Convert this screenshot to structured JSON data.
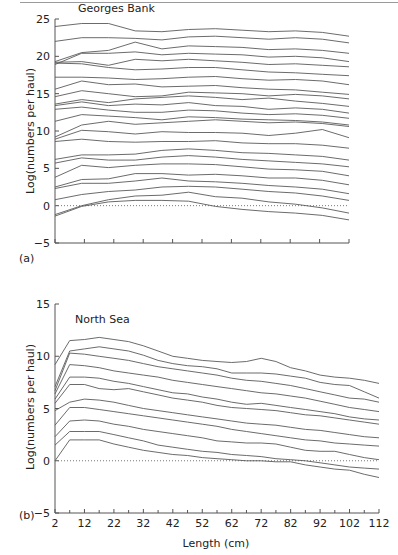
{
  "figure": {
    "panel_a_label": "(a)",
    "panel_b_label": "(b)"
  },
  "chart_data": [
    {
      "type": "line",
      "panel": "(a)",
      "title": "Georges Bank",
      "xlabel": "",
      "ylabel": "Log(numbers per haul)",
      "ylim": [
        -5,
        25
      ],
      "yticks": [
        -5,
        0,
        5,
        10,
        15,
        20,
        25
      ],
      "xticks_count": 10,
      "xlim": [
        2,
        112
      ],
      "x": [
        2,
        12,
        22,
        32,
        42,
        52,
        62,
        72,
        82,
        92,
        102,
        112
      ],
      "reference_line": {
        "y": 0,
        "style": "dotted"
      },
      "series": [
        {
          "name": "cohort 1",
          "values": [
            24.0,
            24.4,
            24.4,
            23.4,
            23.3,
            23.6,
            23.7,
            23.5,
            23.3,
            23.4,
            23.2,
            22.7
          ]
        },
        {
          "name": "cohort 2",
          "values": [
            22.0,
            22.5,
            22.5,
            22.4,
            22.2,
            22.6,
            22.7,
            22.5,
            22.3,
            22.5,
            22.3,
            21.8
          ]
        },
        {
          "name": "cohort 3",
          "values": [
            19.3,
            20.5,
            20.8,
            21.9,
            21.0,
            21.4,
            21.3,
            21.2,
            20.9,
            21.0,
            20.8,
            20.4
          ]
        },
        {
          "name": "cohort 4",
          "values": [
            18.9,
            20.4,
            20.4,
            20.6,
            20.2,
            20.4,
            20.3,
            20.2,
            19.9,
            20.0,
            19.8,
            19.3
          ]
        },
        {
          "name": "cohort 5",
          "values": [
            19.2,
            19.3,
            18.8,
            19.6,
            19.4,
            19.6,
            19.4,
            19.2,
            18.9,
            19.0,
            18.8,
            18.6
          ]
        },
        {
          "name": "cohort 6",
          "values": [
            19.1,
            19.0,
            18.5,
            18.2,
            18.3,
            18.5,
            18.5,
            18.2,
            17.9,
            17.8,
            17.6,
            17.4
          ]
        },
        {
          "name": "cohort 7",
          "values": [
            17.2,
            17.2,
            17.1,
            16.9,
            17.0,
            17.2,
            17.3,
            17.0,
            16.8,
            16.9,
            16.7,
            16.2
          ]
        },
        {
          "name": "cohort 8",
          "values": [
            15.6,
            16.7,
            16.2,
            16.3,
            15.9,
            16.0,
            16.1,
            15.8,
            15.6,
            15.5,
            15.2,
            14.9
          ]
        },
        {
          "name": "cohort 9",
          "values": [
            14.6,
            15.4,
            15.0,
            14.6,
            14.7,
            15.2,
            15.1,
            15.0,
            14.7,
            14.9,
            14.7,
            14.3
          ]
        },
        {
          "name": "cohort 10",
          "values": [
            13.6,
            14.2,
            13.8,
            14.3,
            14.5,
            14.7,
            14.5,
            14.2,
            14.4,
            14.0,
            13.7,
            13.3
          ]
        },
        {
          "name": "cohort 11",
          "values": [
            13.4,
            13.9,
            13.4,
            13.6,
            13.5,
            13.8,
            13.4,
            13.3,
            12.9,
            13.1,
            12.9,
            12.4
          ]
        },
        {
          "name": "cohort 12",
          "values": [
            12.9,
            13.2,
            12.8,
            12.5,
            12.5,
            12.8,
            12.7,
            12.4,
            12.2,
            12.3,
            12.1,
            11.7
          ]
        },
        {
          "name": "cohort 13",
          "values": [
            11.3,
            12.2,
            12.0,
            11.8,
            11.5,
            11.9,
            11.8,
            11.6,
            11.5,
            11.4,
            11.2,
            10.8
          ]
        },
        {
          "name": "cohort 14",
          "values": [
            9.2,
            10.8,
            11.3,
            10.9,
            11.1,
            11.3,
            11.5,
            11.3,
            11.1,
            11.2,
            11.0,
            10.6
          ]
        },
        {
          "name": "cohort 15",
          "values": [
            8.9,
            10.1,
            9.9,
            9.6,
            9.9,
            9.8,
            9.8,
            9.7,
            9.4,
            9.7,
            10.2,
            9.1
          ]
        },
        {
          "name": "cohort 16",
          "values": [
            8.6,
            8.9,
            8.6,
            8.5,
            8.6,
            8.6,
            8.7,
            8.4,
            8.3,
            8.3,
            8.1,
            7.7
          ]
        },
        {
          "name": "cohort 17",
          "values": [
            6.2,
            6.8,
            6.8,
            6.9,
            7.4,
            7.6,
            7.4,
            7.1,
            7.0,
            6.8,
            6.6,
            6.1
          ]
        },
        {
          "name": "cohort 18",
          "values": [
            5.7,
            6.4,
            6.1,
            6.1,
            6.5,
            6.7,
            6.5,
            6.2,
            6.0,
            5.8,
            5.6,
            5.2
          ]
        },
        {
          "name": "cohort 19",
          "values": [
            3.8,
            5.4,
            5.1,
            5.4,
            5.6,
            5.6,
            5.5,
            5.2,
            4.9,
            4.8,
            4.6,
            4.0
          ]
        },
        {
          "name": "cohort 20",
          "values": [
            2.5,
            3.5,
            3.6,
            4.3,
            4.3,
            4.1,
            4.2,
            4.0,
            3.7,
            3.7,
            3.4,
            2.8
          ]
        },
        {
          "name": "cohort 21",
          "values": [
            2.3,
            3.0,
            3.0,
            3.3,
            3.7,
            3.3,
            3.2,
            3.0,
            2.7,
            2.5,
            2.2,
            1.6
          ]
        },
        {
          "name": "cohort 22",
          "values": [
            0.8,
            1.5,
            1.9,
            2.1,
            2.5,
            2.6,
            2.5,
            2.2,
            1.9,
            1.7,
            1.3,
            0.7
          ]
        },
        {
          "name": "cohort 23",
          "values": [
            -1.2,
            0.0,
            0.8,
            1.3,
            1.4,
            1.8,
            1.2,
            1.0,
            0.5,
            0.2,
            -0.3,
            -1.0
          ]
        },
        {
          "name": "cohort 24",
          "values": [
            -1.4,
            -0.1,
            0.5,
            0.7,
            0.7,
            0.6,
            -0.1,
            -0.5,
            -0.8,
            -1.0,
            -1.3,
            -1.9
          ]
        }
      ]
    },
    {
      "type": "line",
      "panel": "(b)",
      "title": "North Sea",
      "xlabel": "Length (cm)",
      "ylabel": "Log(numbers per haul)",
      "ylim": [
        -5,
        15
      ],
      "yticks": [
        -5,
        0,
        5,
        10,
        15
      ],
      "xlim": [
        2,
        112
      ],
      "xticks": [
        2,
        12,
        22,
        32,
        42,
        52,
        62,
        72,
        82,
        92,
        102,
        112
      ],
      "x": [
        2,
        7,
        12,
        17,
        22,
        27,
        32,
        37,
        42,
        47,
        52,
        57,
        62,
        67,
        72,
        77,
        82,
        87,
        92,
        97,
        102,
        107,
        112
      ],
      "reference_line": {
        "y": 0,
        "style": "dotted"
      },
      "series": [
        {
          "name": "cohort 1",
          "values": [
            9.2,
            11.5,
            11.6,
            11.8,
            11.6,
            11.4,
            11.0,
            10.5,
            10.0,
            9.8,
            9.6,
            9.5,
            9.4,
            9.5,
            9.8,
            9.5,
            8.9,
            8.6,
            8.2,
            8.0,
            7.9,
            7.7,
            7.4
          ]
        },
        {
          "name": "cohort 2",
          "values": [
            7.1,
            10.5,
            10.7,
            10.9,
            10.7,
            10.5,
            10.1,
            9.6,
            9.3,
            9.1,
            9.0,
            8.8,
            8.4,
            8.4,
            8.4,
            8.3,
            8.1,
            7.9,
            7.5,
            7.3,
            7.2,
            6.6,
            6.0
          ]
        },
        {
          "name": "cohort 3",
          "values": [
            6.7,
            10.3,
            10.2,
            10.0,
            9.8,
            9.6,
            9.3,
            9.0,
            8.8,
            8.6,
            8.4,
            8.2,
            7.9,
            7.7,
            7.6,
            7.4,
            7.2,
            6.9,
            6.6,
            6.3,
            6.0,
            5.9,
            5.6
          ]
        },
        {
          "name": "cohort 4",
          "values": [
            6.4,
            9.2,
            9.1,
            8.9,
            8.6,
            8.4,
            8.2,
            8.0,
            7.7,
            7.5,
            7.3,
            7.1,
            6.9,
            6.7,
            6.5,
            6.4,
            6.2,
            6.0,
            5.7,
            5.4,
            5.1,
            4.9,
            4.7
          ]
        },
        {
          "name": "cohort 5",
          "values": [
            5.9,
            8.0,
            8.0,
            7.9,
            7.6,
            7.4,
            7.1,
            6.8,
            6.5,
            6.4,
            6.1,
            5.9,
            5.6,
            5.4,
            5.5,
            5.3,
            5.1,
            4.9,
            4.7,
            4.5,
            4.2,
            4.0,
            3.9
          ]
        },
        {
          "name": "cohort 6",
          "values": [
            5.5,
            7.3,
            7.3,
            6.9,
            6.8,
            6.9,
            6.6,
            6.3,
            6.0,
            5.8,
            5.6,
            5.3,
            5.1,
            5.0,
            4.9,
            4.8,
            4.6,
            4.4,
            4.3,
            4.1,
            3.9,
            3.7,
            3.5
          ]
        },
        {
          "name": "cohort 7",
          "values": [
            4.8,
            5.6,
            5.9,
            5.8,
            5.6,
            5.3,
            5.0,
            4.8,
            4.6,
            4.4,
            4.2,
            4.0,
            3.8,
            3.6,
            3.5,
            3.4,
            3.2,
            3.0,
            2.9,
            2.7,
            2.5,
            2.3,
            2.2
          ]
        },
        {
          "name": "cohort 8",
          "values": [
            3.4,
            5.1,
            5.1,
            4.9,
            4.7,
            4.5,
            4.3,
            4.1,
            3.9,
            3.7,
            3.5,
            3.3,
            3.0,
            2.8,
            2.6,
            2.4,
            2.2,
            2.0,
            1.9,
            1.7,
            1.6,
            1.5,
            1.4
          ]
        },
        {
          "name": "cohort 9",
          "values": [
            2.3,
            3.8,
            3.9,
            3.8,
            3.5,
            3.3,
            3.0,
            2.8,
            2.6,
            2.4,
            2.2,
            1.9,
            1.8,
            1.7,
            1.7,
            1.6,
            1.3,
            1.0,
            0.9,
            0.9,
            0.6,
            0.3,
            0.1
          ]
        },
        {
          "name": "cohort 10",
          "values": [
            1.5,
            2.8,
            2.8,
            2.8,
            2.5,
            2.2,
            1.9,
            1.5,
            1.3,
            1.1,
            0.9,
            0.8,
            0.6,
            0.5,
            0.4,
            0.2,
            0.1,
            0.0,
            -0.2,
            -0.4,
            -0.6,
            -0.7,
            -0.8
          ]
        },
        {
          "name": "cohort 11",
          "values": [
            0.0,
            2.0,
            2.0,
            2.0,
            1.6,
            1.3,
            1.0,
            0.8,
            0.6,
            0.5,
            0.3,
            0.2,
            0.1,
            0.0,
            0.0,
            -0.1,
            -0.1,
            -0.4,
            -0.6,
            -0.8,
            -0.9,
            -1.3,
            -1.6
          ]
        }
      ]
    }
  ]
}
